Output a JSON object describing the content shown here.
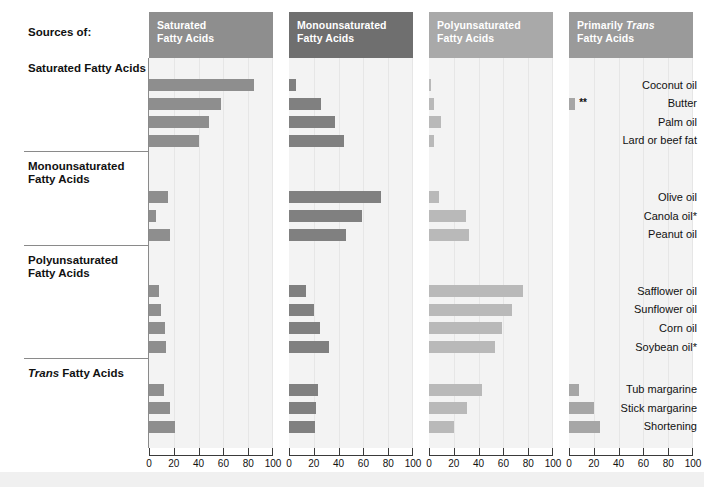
{
  "left_header": "Sources of:",
  "columns": [
    {
      "id": "saturated",
      "title_line1": "Saturated",
      "title_line2": "Fatty Acids",
      "color": "#8e8e8e"
    },
    {
      "id": "monounsaturated",
      "title_line1": "Monounsaturated",
      "title_line2": "Fatty Acids",
      "color": "#6f6f6f"
    },
    {
      "id": "polyunsaturated",
      "title_line1": "Polyunsaturated",
      "title_line2": "Fatty Acids",
      "color": "#a9a9a9"
    },
    {
      "id": "trans",
      "title_line1": "Primarily Trans",
      "title_line2": "Fatty Acids",
      "color": "#9a9a9a"
    }
  ],
  "groups": [
    {
      "title_line1": "Saturated Fatty Acids",
      "title_line2": "",
      "rows": [
        "Coconut oil",
        "Butter",
        "Palm oil",
        "Lard or beef fat"
      ]
    },
    {
      "title_line1": "Monounsaturated",
      "title_line2": "Fatty Acids",
      "rows": [
        "Olive oil",
        "Canola oil*",
        "Peanut oil"
      ]
    },
    {
      "title_line1": "Polyunsaturated",
      "title_line2": "Fatty Acids",
      "rows": [
        "Safflower oil",
        "Sunflower oil",
        "Corn oil",
        "Soybean oil*"
      ]
    },
    {
      "title_line1": "Trans Fatty Acids",
      "title_line2": "",
      "rows": [
        "Tub margarine",
        "Stick margarine",
        "Shortening"
      ]
    }
  ],
  "axis": {
    "ticks": [
      0,
      20,
      40,
      60,
      80,
      100
    ],
    "min": 0,
    "max": 100
  },
  "annotations": [
    {
      "row": "Butter",
      "column": "trans",
      "text": "**"
    }
  ],
  "chart_data": {
    "type": "bar",
    "xlabel": "",
    "ylabel": "",
    "xlim": [
      0,
      100
    ],
    "grid": true,
    "legend": "none",
    "orientation": "horizontal",
    "panels": [
      "Saturated Fatty Acids",
      "Monounsaturated Fatty Acids",
      "Polyunsaturated Fatty Acids",
      "Primarily Trans Fatty Acids"
    ],
    "categories": [
      "Coconut oil",
      "Butter",
      "Palm oil",
      "Lard or beef fat",
      "Olive oil",
      "Canola oil*",
      "Peanut oil",
      "Safflower oil",
      "Sunflower oil",
      "Corn oil",
      "Soybean oil*",
      "Tub margarine",
      "Stick margarine",
      "Shortening"
    ],
    "series": [
      {
        "name": "Saturated Fatty Acids",
        "values": [
          85,
          58,
          48,
          40,
          15,
          6,
          17,
          8,
          10,
          13,
          14,
          12,
          17,
          21
        ]
      },
      {
        "name": "Monounsaturated Fatty Acids",
        "values": [
          6,
          26,
          37,
          44,
          74,
          59,
          46,
          14,
          20,
          25,
          32,
          23,
          22,
          21
        ]
      },
      {
        "name": "Polyunsaturated Fatty Acids",
        "values": [
          2,
          4,
          10,
          4,
          8,
          30,
          32,
          76,
          67,
          59,
          53,
          43,
          31,
          20
        ]
      },
      {
        "name": "Primarily Trans Fatty Acids",
        "values": [
          0,
          5,
          0,
          0,
          0,
          0,
          0,
          0,
          0,
          0,
          0,
          8,
          20,
          25
        ]
      }
    ]
  }
}
